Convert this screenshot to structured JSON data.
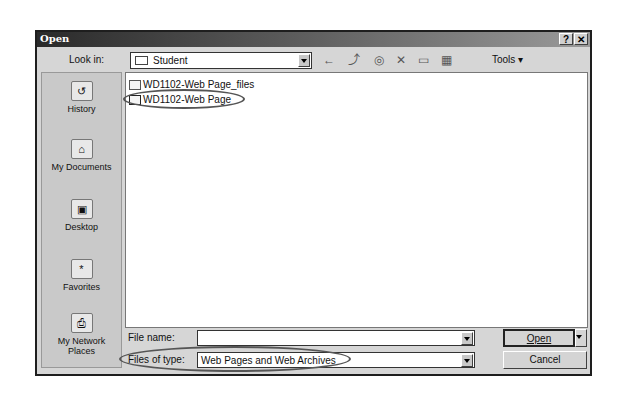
{
  "dialog": {
    "title": "Open",
    "help_label": "?",
    "close_label": "✕"
  },
  "toolbar": {
    "look_in_label": "Look in:",
    "look_in_value": "Student",
    "back_icon": "←",
    "up_icon": "⤴",
    "search_icon": "◎",
    "delete_icon": "✕",
    "new_folder_icon": "▭",
    "views_icon": "▦",
    "tools_label": "Tools ▾"
  },
  "places": [
    {
      "label": "History",
      "icon": "↺"
    },
    {
      "label": "My Documents",
      "icon": "⌂"
    },
    {
      "label": "Desktop",
      "icon": "▣"
    },
    {
      "label": "Favorites",
      "icon": "*"
    },
    {
      "label": "My Network Places",
      "icon": "⎙"
    }
  ],
  "files": [
    {
      "name": "WD1102-Web Page_files",
      "type": "folder"
    },
    {
      "name": "WD1102-Web Page",
      "type": "web-page"
    }
  ],
  "footer": {
    "file_name_label": "File name:",
    "file_name_value": "",
    "files_of_type_label": "Files of type:",
    "files_of_type_value": "Web Pages and Web Archives",
    "open_label": "Open",
    "cancel_label": "Cancel"
  }
}
